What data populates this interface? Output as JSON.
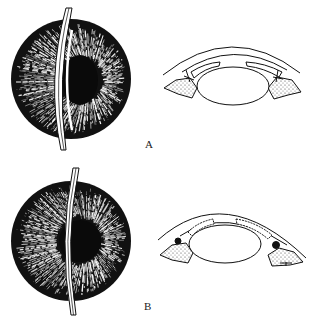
{
  "figure": {
    "panels": [
      {
        "id": "A",
        "label": "A",
        "front_view": {
          "cx": 71,
          "cy": 79,
          "r": 60,
          "pupil": {
            "cx": 80,
            "cy": 80,
            "rx": 18,
            "ry": 24
          },
          "suture": {
            "top": [
              68,
              8
            ],
            "ctrl": [
              48,
              80
            ],
            "bottom": [
              64,
              150
            ]
          }
        },
        "cross_section": {
          "lens_center": [
            233,
            86
          ],
          "lens_rx": 36,
          "lens_ry": 19
        }
      },
      {
        "id": "B",
        "label": "B",
        "front_view": {
          "cx": 71,
          "cy": 241,
          "r": 60,
          "pupil": {
            "cx": 79,
            "cy": 241,
            "rx": 21,
            "ry": 21
          },
          "suture": {
            "top": [
              75,
              168
            ],
            "ctrl": [
              60,
              241
            ],
            "bottom": [
              73,
              315
            ]
          }
        },
        "cross_section": {
          "lens_center": [
            225,
            244
          ],
          "lens_rx": 36,
          "lens_ry": 19
        }
      }
    ],
    "colors": {
      "ink": "#111111",
      "paper": "#ffffff",
      "stipple": "#555555"
    }
  }
}
